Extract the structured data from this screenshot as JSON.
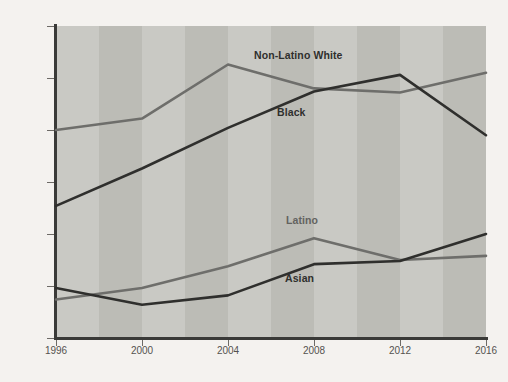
{
  "chart_data": {
    "type": "line",
    "title": "",
    "subtitle": "",
    "xlabel": "",
    "ylabel": "",
    "x": [
      1996,
      2000,
      2004,
      2008,
      2012,
      2016
    ],
    "xtick_labels": [
      "1996",
      "2000",
      "2004",
      "2008",
      "2012",
      "2016"
    ],
    "ytick_labels": [
      "40",
      "45",
      "50",
      "55",
      "60",
      "65",
      "70%"
    ],
    "ytick_values": [
      40,
      45,
      50,
      55,
      60,
      65,
      70
    ],
    "ylim": [
      40,
      70
    ],
    "xlim": [
      1996,
      2016
    ],
    "grid": false,
    "legend_position": "inline-annotations",
    "background_bands": true,
    "series": [
      {
        "name": "Non-Latino White",
        "color": "#6e6e6b",
        "values": [
          60.0,
          61.1,
          66.3,
          64.0,
          63.6,
          65.5
        ]
      },
      {
        "name": "Black",
        "color": "#2f2f2d",
        "values": [
          52.7,
          56.3,
          60.2,
          63.7,
          65.3,
          59.5
        ]
      },
      {
        "name": "Latino",
        "color": "#6e6e6b",
        "values": [
          43.7,
          44.8,
          46.9,
          49.6,
          47.5,
          47.9
        ]
      },
      {
        "name": "Asian",
        "color": "#2f2f2d",
        "values": [
          44.8,
          43.2,
          44.1,
          47.1,
          47.4,
          50.0
        ]
      }
    ],
    "annotations": [
      {
        "text": "Non-Latino White",
        "x_px": 254,
        "y_px": 49,
        "style": "dark"
      },
      {
        "text": "Black",
        "x_px": 277,
        "y_px": 106,
        "style": "dark"
      },
      {
        "text": "Latino",
        "x_px": 286,
        "y_px": 214,
        "style": "gray"
      },
      {
        "text": "Asian",
        "x_px": 285,
        "y_px": 272,
        "style": "dark"
      }
    ]
  },
  "colors": {
    "page_background": "#f4f2ef",
    "plot_background": "#c9c9c4",
    "plot_band": "#bcbcb6",
    "axis": "#3a3a38",
    "tick_text": "#55524f",
    "series_dark": "#2f2f2d",
    "series_gray": "#6e6e6b"
  }
}
